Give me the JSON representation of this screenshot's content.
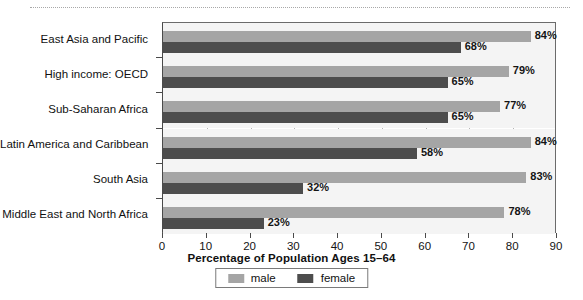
{
  "chart_data": {
    "type": "bar",
    "orientation": "horizontal",
    "title": "",
    "xlabel": "Percentage of Population Ages 15–64",
    "ylabel": "",
    "xlim": [
      0,
      90
    ],
    "xticks": [
      0,
      10,
      20,
      30,
      40,
      50,
      60,
      70,
      80,
      90
    ],
    "xtick_labels": [
      "0",
      "10",
      "20",
      "30",
      "40",
      "50",
      "60",
      "70",
      "80",
      "90"
    ],
    "grid": "vertical",
    "legend_position": "bottom-center",
    "categories": [
      "East Asia and Pacific",
      "High income: OECD",
      "Sub-Saharan Africa",
      "Latin America and Caribbean",
      "South Asia",
      "Middle East and North Africa"
    ],
    "series": [
      {
        "name": "male",
        "color": "#a5a5a5",
        "values": [
          84,
          79,
          77,
          84,
          83,
          78
        ],
        "data_labels": [
          "84%",
          "79%",
          "77%",
          "84%",
          "83%",
          "78%"
        ]
      },
      {
        "name": "female",
        "color": "#4d4d4d",
        "values": [
          68,
          65,
          65,
          58,
          32,
          23
        ],
        "data_labels": [
          "68%",
          "65%",
          "65%",
          "58%",
          "32%",
          "23%"
        ]
      }
    ]
  },
  "legend": {
    "items": [
      {
        "label": "male",
        "color": "#a5a5a5"
      },
      {
        "label": "female",
        "color": "#4d4d4d"
      }
    ]
  },
  "axis": {
    "x_title": "Percentage of Population Ages 15–64"
  }
}
